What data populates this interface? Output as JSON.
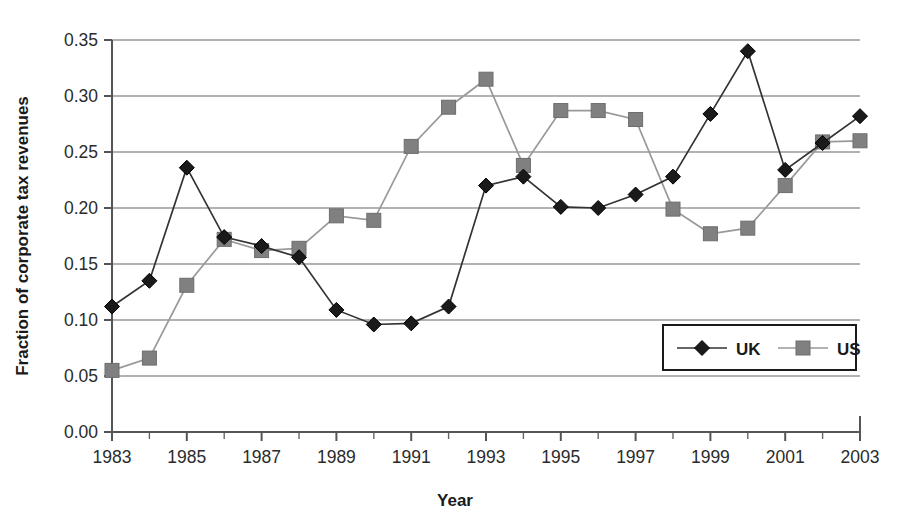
{
  "chart_data": {
    "type": "line",
    "title": "",
    "xlabel": "Year",
    "ylabel": "Fraction of corporate tax revenues",
    "x": [
      1983,
      1984,
      1985,
      1986,
      1987,
      1988,
      1989,
      1990,
      1991,
      1992,
      1993,
      1994,
      1995,
      1996,
      1997,
      1998,
      1999,
      2000,
      2001,
      2002,
      2003
    ],
    "xlim": [
      1983,
      2003
    ],
    "ylim": [
      0.0,
      0.35
    ],
    "y_ticks": [
      0.0,
      0.05,
      0.1,
      0.15,
      0.2,
      0.25,
      0.3,
      0.35
    ],
    "y_tick_labels": [
      "0.00",
      "0.05",
      "0.10",
      "0.15",
      "0.20",
      "0.25",
      "0.30",
      "0.35"
    ],
    "x_tick_labels": [
      "1983",
      "1985",
      "1987",
      "1989",
      "1991",
      "1993",
      "1995",
      "1997",
      "1999",
      "2001",
      "2003"
    ],
    "x_tick_values": [
      1983,
      1985,
      1987,
      1989,
      1991,
      1993,
      1995,
      1997,
      1999,
      2001,
      2003
    ],
    "x_minor_ticks": [
      1984,
      1986,
      1988,
      1990,
      1992,
      1994,
      1996,
      1998,
      2000,
      2002
    ],
    "grid": "horizontal",
    "legend_position": "bottom-right",
    "series": [
      {
        "name": "UK",
        "marker": "diamond",
        "color": "#1a1a1a",
        "line_color": "#333333",
        "values": [
          0.112,
          0.135,
          0.236,
          0.174,
          0.166,
          0.156,
          0.109,
          0.096,
          0.097,
          0.112,
          0.22,
          0.228,
          0.201,
          0.2,
          0.212,
          0.228,
          0.284,
          0.34,
          0.234,
          0.258,
          0.282
        ]
      },
      {
        "name": "US",
        "marker": "square",
        "color": "#808080",
        "line_color": "#999999",
        "values": [
          0.055,
          0.066,
          0.131,
          0.172,
          0.162,
          0.164,
          0.193,
          0.189,
          0.255,
          0.29,
          0.315,
          0.238,
          0.287,
          0.287,
          0.279,
          0.199,
          0.177,
          0.182,
          0.22,
          0.259,
          0.26
        ]
      }
    ]
  },
  "legend": {
    "entries": [
      {
        "label": "UK"
      },
      {
        "label": "US"
      }
    ]
  },
  "axes": {
    "x_title": "Year",
    "y_title": "Fraction of corporate tax revenues"
  }
}
